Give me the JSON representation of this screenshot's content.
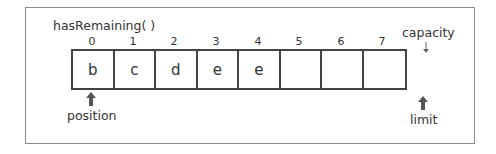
{
  "diagram": {
    "title": "hasRemaining( )",
    "cells": [
      {
        "index": "0",
        "value": "b"
      },
      {
        "index": "1",
        "value": "c"
      },
      {
        "index": "2",
        "value": "d"
      },
      {
        "index": "3",
        "value": "e"
      },
      {
        "index": "4",
        "value": "e"
      },
      {
        "index": "5",
        "value": ""
      },
      {
        "index": "6",
        "value": ""
      },
      {
        "index": "7",
        "value": ""
      }
    ],
    "markers": {
      "position": {
        "label": "position",
        "icon": "thick-up-arrow",
        "at_index": 0
      },
      "limit": {
        "label": "limit",
        "icon": "thick-up-arrow",
        "at_index": 8
      },
      "capacity": {
        "label": "capacity",
        "icon": "thin-down-arrow",
        "at_index": 8
      }
    },
    "colors": {
      "border": "#444444",
      "frame": "#8c8c8c",
      "text": "#333333",
      "arrow": "#555555"
    }
  }
}
